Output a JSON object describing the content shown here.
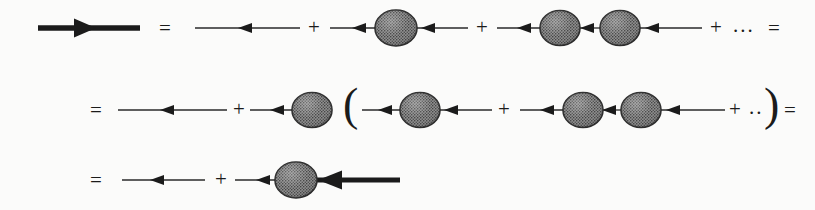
{
  "figure": {
    "type": "feynman-diagram",
    "width": 815,
    "height": 210,
    "background_color": "#fbfbfa",
    "ink_color": "#1b1b1b",
    "blob_fill_color": "#6f6f6f",
    "blob_edge_color": "#2b2b2b",
    "blob_texture": "cross-hatch-dots"
  },
  "symbols": {
    "equals": "=",
    "plus": "+",
    "ellipsis_long": "...",
    "ellipsis_short": "..",
    "paren_open": "(",
    "paren_close": ")"
  },
  "rows": [
    {
      "id": "row-1",
      "label": "full-propagator-expansion",
      "terms": [
        {
          "kind": "bold-arrow",
          "name": "full-propagator-bold-arrow"
        },
        {
          "kind": "operator",
          "name": "equals-sign-row1",
          "text": "="
        },
        {
          "kind": "thin-arrow",
          "name": "bare-propagator-line"
        },
        {
          "kind": "operator",
          "name": "plus-sign-row1-a",
          "text": "+"
        },
        {
          "kind": "one-blob",
          "name": "single-self-energy-insertion"
        },
        {
          "kind": "operator",
          "name": "plus-sign-row1-b",
          "text": "+"
        },
        {
          "kind": "two-blob",
          "name": "double-self-energy-insertion"
        },
        {
          "kind": "operator",
          "name": "plus-sign-row1-c",
          "text": "+"
        },
        {
          "kind": "operator",
          "name": "ellipsis-row1",
          "text": "..."
        },
        {
          "kind": "operator",
          "name": "equals-sign-row1-end",
          "text": "="
        }
      ]
    },
    {
      "id": "row-2",
      "label": "factored-expansion",
      "terms": [
        {
          "kind": "operator",
          "name": "equals-sign-row2",
          "text": "="
        },
        {
          "kind": "thin-arrow",
          "name": "bare-propagator-line-row2"
        },
        {
          "kind": "operator",
          "name": "plus-sign-row2-a",
          "text": "+"
        },
        {
          "kind": "one-blob",
          "name": "self-energy-blob-prefactor"
        },
        {
          "kind": "operator",
          "name": "paren-open-row2",
          "text": "("
        },
        {
          "kind": "one-blob",
          "name": "bracketed-bare-term"
        },
        {
          "kind": "operator",
          "name": "plus-sign-row2-b",
          "text": "+"
        },
        {
          "kind": "two-blob",
          "name": "bracketed-double-term"
        },
        {
          "kind": "operator",
          "name": "plus-sign-row2-c",
          "text": "+"
        },
        {
          "kind": "operator",
          "name": "ellipsis-row2",
          "text": ".."
        },
        {
          "kind": "operator",
          "name": "paren-close-row2",
          "text": ")"
        },
        {
          "kind": "operator",
          "name": "equals-sign-row2-end",
          "text": "="
        }
      ]
    },
    {
      "id": "row-3",
      "label": "dyson-equation-closed-form",
      "terms": [
        {
          "kind": "operator",
          "name": "equals-sign-row3",
          "text": "="
        },
        {
          "kind": "thin-arrow",
          "name": "bare-propagator-line-row3"
        },
        {
          "kind": "operator",
          "name": "plus-sign-row3",
          "text": "+"
        },
        {
          "kind": "blob-bold",
          "name": "self-energy-times-full-propagator"
        }
      ]
    }
  ],
  "annotations": {
    "row1_equals_positions": [
      "x=165",
      "x=765"
    ],
    "row2_equals_positions": [
      "x=95",
      "x=785"
    ],
    "row3_equals_positions": [
      "x=95"
    ]
  }
}
